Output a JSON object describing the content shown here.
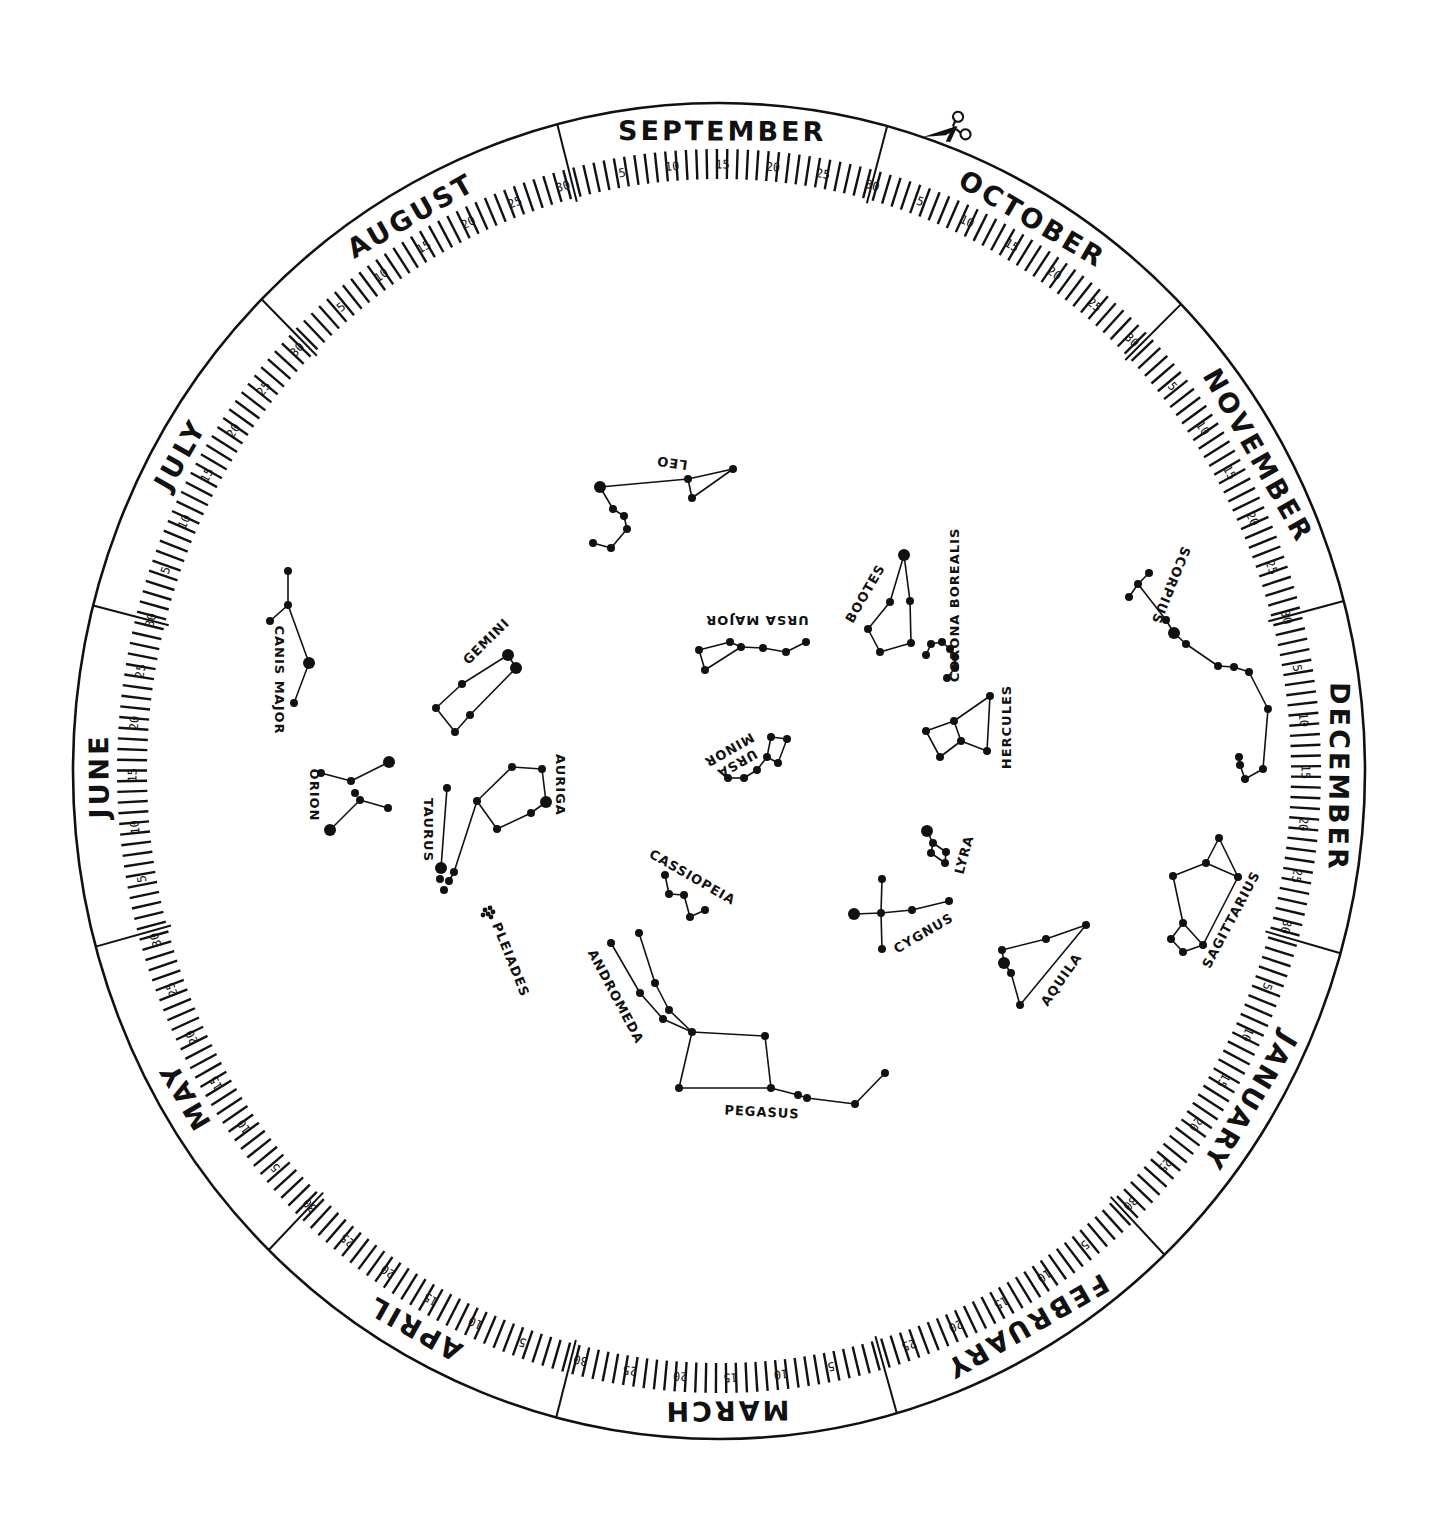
{
  "ring": {
    "center": [
      719,
      771
    ],
    "outer": [
      646,
      668
    ],
    "tick_base": [
      572,
      592
    ],
    "tick_len_minor": 30,
    "tick_len_major": 40,
    "label_radius": [
      618,
      638
    ],
    "start_angle_deg": -104.5,
    "color": "#111111"
  },
  "months": [
    {
      "name": "SEPTEMBER",
      "days": 30
    },
    {
      "name": "OCTOBER",
      "days": 31
    },
    {
      "name": "NOVEMBER",
      "days": 30
    },
    {
      "name": "DECEMBER",
      "days": 31
    },
    {
      "name": "JANUARY",
      "days": 31
    },
    {
      "name": "FEBRUARY",
      "days": 28
    },
    {
      "name": "MARCH",
      "days": 31
    },
    {
      "name": "APRIL",
      "days": 30
    },
    {
      "name": "MAY",
      "days": 31
    },
    {
      "name": "JUNE",
      "days": 30
    },
    {
      "name": "JULY",
      "days": 31
    },
    {
      "name": "AUGUST",
      "days": 31
    }
  ],
  "day_labels": [
    5,
    10,
    15,
    20,
    25,
    30
  ],
  "scissors": {
    "icon": "scissors-icon",
    "x": 948,
    "y": 130
  },
  "constellations": [
    {
      "name": "LEO",
      "label": {
        "x": 672,
        "y": 462,
        "rot": 188
      },
      "stars": [
        [
          600,
          487,
          6
        ],
        [
          613,
          509,
          4
        ],
        [
          624,
          516,
          4
        ],
        [
          627,
          529,
          4
        ],
        [
          611,
          548,
          4
        ],
        [
          593,
          543,
          4
        ],
        [
          688,
          479,
          4
        ],
        [
          692,
          498,
          4
        ],
        [
          733,
          469,
          4
        ]
      ],
      "lines": [
        [
          0,
          1
        ],
        [
          1,
          2
        ],
        [
          2,
          3
        ],
        [
          3,
          4
        ],
        [
          4,
          5
        ],
        [
          0,
          6
        ],
        [
          6,
          8
        ],
        [
          6,
          7
        ],
        [
          7,
          8
        ]
      ]
    },
    {
      "name": "URSA MAJOR",
      "label": {
        "x": 757,
        "y": 619,
        "rot": 180
      },
      "stars": [
        [
          730,
          642,
          4
        ],
        [
          699,
          650,
          4
        ],
        [
          705,
          670,
          4
        ],
        [
          741,
          647,
          4
        ],
        [
          763,
          648,
          4
        ],
        [
          786,
          652,
          4
        ],
        [
          806,
          642,
          4
        ]
      ],
      "lines": [
        [
          0,
          1
        ],
        [
          1,
          2
        ],
        [
          2,
          3
        ],
        [
          3,
          0
        ],
        [
          3,
          4
        ],
        [
          4,
          5
        ],
        [
          5,
          6
        ]
      ]
    },
    {
      "name": "URSA MINOR",
      "label": {
        "x": 735,
        "y": 760,
        "rot": 150,
        "two_line": [
          "URSA",
          "MINOR"
        ]
      },
      "stars": [
        [
          771,
          737,
          4
        ],
        [
          787,
          739,
          4
        ],
        [
          767,
          757,
          4
        ],
        [
          778,
          763,
          4
        ],
        [
          757,
          770,
          4
        ],
        [
          744,
          778,
          4
        ],
        [
          728,
          778,
          4
        ]
      ],
      "lines": [
        [
          0,
          1
        ],
        [
          1,
          3
        ],
        [
          3,
          2
        ],
        [
          2,
          0
        ],
        [
          2,
          4
        ],
        [
          4,
          5
        ],
        [
          5,
          6
        ]
      ]
    },
    {
      "name": "BOOTES",
      "label": {
        "x": 866,
        "y": 594,
        "rot": -60
      },
      "stars": [
        [
          904,
          555,
          6
        ],
        [
          890,
          602,
          4
        ],
        [
          910,
          601,
          4
        ],
        [
          868,
          629,
          4
        ],
        [
          880,
          652,
          4
        ],
        [
          911,
          643,
          4
        ]
      ],
      "lines": [
        [
          0,
          1
        ],
        [
          0,
          2
        ],
        [
          1,
          3
        ],
        [
          3,
          4
        ],
        [
          4,
          5
        ],
        [
          5,
          2
        ]
      ]
    },
    {
      "name": "CORONA BOREALIS",
      "label": {
        "x": 955,
        "y": 605,
        "rot": -90
      },
      "stars": [
        [
          926,
          655,
          4
        ],
        [
          931,
          644,
          4
        ],
        [
          942,
          642,
          4
        ],
        [
          950,
          649,
          4
        ],
        [
          955,
          657,
          4
        ],
        [
          955,
          668,
          4
        ],
        [
          947,
          678,
          4
        ]
      ],
      "lines": [
        [
          0,
          1
        ],
        [
          1,
          2
        ],
        [
          2,
          3
        ],
        [
          3,
          4
        ],
        [
          4,
          5
        ],
        [
          5,
          6
        ]
      ]
    },
    {
      "name": "HERCULES",
      "label": {
        "x": 1007,
        "y": 727,
        "rot": -90
      },
      "stars": [
        [
          990,
          696,
          4
        ],
        [
          954,
          721,
          4
        ],
        [
          926,
          731,
          4
        ],
        [
          940,
          757,
          4
        ],
        [
          961,
          741,
          4
        ],
        [
          987,
          751,
          4
        ]
      ],
      "lines": [
        [
          0,
          1
        ],
        [
          1,
          2
        ],
        [
          2,
          3
        ],
        [
          3,
          4
        ],
        [
          4,
          1
        ],
        [
          4,
          5
        ],
        [
          5,
          0
        ]
      ]
    },
    {
      "name": "LYRA",
      "label": {
        "x": 965,
        "y": 855,
        "rot": -75
      },
      "stars": [
        [
          927,
          831,
          6
        ],
        [
          933,
          843,
          4
        ],
        [
          931,
          853,
          4
        ],
        [
          946,
          852,
          4
        ],
        [
          945,
          863,
          4
        ]
      ],
      "lines": [
        [
          0,
          1
        ],
        [
          1,
          2
        ],
        [
          2,
          4
        ],
        [
          4,
          3
        ],
        [
          3,
          1
        ]
      ]
    },
    {
      "name": "CYGNUS",
      "label": {
        "x": 924,
        "y": 934,
        "rot": -30
      },
      "stars": [
        [
          882,
          879,
          4
        ],
        [
          854,
          914,
          6
        ],
        [
          881,
          913,
          4
        ],
        [
          912,
          910,
          4
        ],
        [
          949,
          901,
          4
        ],
        [
          882,
          949,
          4
        ]
      ],
      "lines": [
        [
          0,
          2
        ],
        [
          2,
          5
        ],
        [
          1,
          2
        ],
        [
          2,
          3
        ],
        [
          3,
          4
        ]
      ]
    },
    {
      "name": "AQUILA",
      "label": {
        "x": 1062,
        "y": 980,
        "rot": -55
      },
      "stars": [
        [
          1086,
          925,
          4
        ],
        [
          1046,
          939,
          4
        ],
        [
          1002,
          950,
          4
        ],
        [
          1004,
          963,
          6
        ],
        [
          1011,
          973,
          4
        ],
        [
          1020,
          1005,
          4
        ]
      ],
      "lines": [
        [
          0,
          1
        ],
        [
          1,
          2
        ],
        [
          2,
          3
        ],
        [
          3,
          4
        ],
        [
          4,
          5
        ],
        [
          5,
          0
        ]
      ]
    },
    {
      "name": "SCORPIUS",
      "label": {
        "x": 1170,
        "y": 585,
        "rot": 112
      },
      "stars": [
        [
          1149,
          573,
          4
        ],
        [
          1138,
          584,
          4
        ],
        [
          1129,
          597,
          4
        ],
        [
          1166,
          620,
          4
        ],
        [
          1174,
          633,
          6
        ],
        [
          1186,
          644,
          4
        ],
        [
          1218,
          666,
          4
        ],
        [
          1234,
          667,
          4
        ],
        [
          1249,
          672,
          4
        ],
        [
          1268,
          709,
          4
        ],
        [
          1263,
          769,
          4
        ],
        [
          1245,
          779,
          4
        ],
        [
          1240,
          765,
          4
        ],
        [
          1239,
          757,
          4
        ]
      ],
      "lines": [
        [
          0,
          1
        ],
        [
          1,
          2
        ],
        [
          1,
          3
        ],
        [
          3,
          4
        ],
        [
          4,
          5
        ],
        [
          5,
          6
        ],
        [
          6,
          7
        ],
        [
          7,
          8
        ],
        [
          8,
          9
        ],
        [
          9,
          10
        ],
        [
          10,
          11
        ],
        [
          11,
          12
        ],
        [
          12,
          13
        ]
      ]
    },
    {
      "name": "SAGITTARIUS",
      "label": {
        "x": 1232,
        "y": 920,
        "rot": -62
      },
      "stars": [
        [
          1219,
          838,
          4
        ],
        [
          1206,
          863,
          4
        ],
        [
          1173,
          876,
          4
        ],
        [
          1238,
          877,
          4
        ],
        [
          1183,
          923,
          4
        ],
        [
          1171,
          939,
          4
        ],
        [
          1183,
          952,
          4
        ],
        [
          1203,
          945,
          4
        ]
      ],
      "lines": [
        [
          0,
          1
        ],
        [
          0,
          3
        ],
        [
          1,
          2
        ],
        [
          1,
          3
        ],
        [
          2,
          4
        ],
        [
          4,
          5
        ],
        [
          5,
          6
        ],
        [
          6,
          7
        ],
        [
          7,
          4
        ],
        [
          7,
          3
        ]
      ]
    },
    {
      "name": "CASSIOPEIA",
      "label": {
        "x": 692,
        "y": 878,
        "rot": 30
      },
      "stars": [
        [
          665,
          875,
          4
        ],
        [
          669,
          894,
          4
        ],
        [
          684,
          895,
          4
        ],
        [
          690,
          917,
          4
        ],
        [
          705,
          910,
          4
        ]
      ],
      "lines": [
        [
          0,
          1
        ],
        [
          1,
          2
        ],
        [
          2,
          3
        ],
        [
          3,
          4
        ]
      ]
    },
    {
      "name": "ANDROMEDA",
      "label": {
        "x": 615,
        "y": 997,
        "rot": 62
      },
      "stars": [
        [
          611,
          943,
          4
        ],
        [
          639,
          933,
          4
        ],
        [
          640,
          993,
          4
        ],
        [
          655,
          983,
          4
        ],
        [
          669,
          1010,
          4
        ],
        [
          663,
          1019,
          4
        ]
      ],
      "lines": [
        [
          0,
          2
        ],
        [
          2,
          5
        ],
        [
          1,
          3
        ],
        [
          3,
          4
        ]
      ]
    },
    {
      "name": "PEGASUS",
      "label": {
        "x": 762,
        "y": 1113,
        "rot": 3
      },
      "stars": [
        [
          692,
          1032,
          4
        ],
        [
          765,
          1036,
          4
        ],
        [
          679,
          1088,
          4
        ],
        [
          771,
          1088,
          4
        ],
        [
          798,
          1095,
          4
        ],
        [
          807,
          1098,
          4
        ],
        [
          855,
          1104,
          4
        ],
        [
          885,
          1073,
          4
        ]
      ],
      "lines": [
        [
          0,
          1
        ],
        [
          1,
          3
        ],
        [
          3,
          2
        ],
        [
          2,
          0
        ],
        [
          3,
          4
        ],
        [
          4,
          5
        ],
        [
          5,
          6
        ],
        [
          6,
          7
        ]
      ],
      "extra_lines": [
        [
          669,
          1010,
          692,
          1032
        ],
        [
          663,
          1019,
          692,
          1032
        ]
      ]
    },
    {
      "name": "GEMINI",
      "label": {
        "x": 487,
        "y": 642,
        "rot": -45
      },
      "stars": [
        [
          508,
          655,
          6
        ],
        [
          516,
          668,
          6
        ],
        [
          462,
          684,
          4
        ],
        [
          436,
          708,
          4
        ],
        [
          455,
          732,
          4
        ],
        [
          470,
          715,
          4
        ]
      ],
      "lines": [
        [
          0,
          1
        ],
        [
          0,
          2
        ],
        [
          2,
          3
        ],
        [
          3,
          4
        ],
        [
          4,
          5
        ],
        [
          5,
          1
        ]
      ]
    },
    {
      "name": "CANIS MAJOR",
      "label": {
        "x": 278,
        "y": 680,
        "rot": 90
      },
      "stars": [
        [
          288,
          571,
          4
        ],
        [
          288,
          605,
          4
        ],
        [
          270,
          621,
          4
        ],
        [
          309,
          663,
          6
        ],
        [
          294,
          703,
          4
        ]
      ],
      "lines": [
        [
          0,
          1
        ],
        [
          1,
          2
        ],
        [
          1,
          3
        ],
        [
          3,
          4
        ]
      ]
    },
    {
      "name": "ORION",
      "label": {
        "x": 313,
        "y": 795,
        "rot": 90
      },
      "stars": [
        [
          389,
          762,
          6
        ],
        [
          321,
          773,
          4
        ],
        [
          351,
          781,
          4
        ],
        [
          355,
          793,
          4
        ],
        [
          360,
          800,
          4
        ],
        [
          388,
          808,
          4
        ],
        [
          330,
          830,
          6
        ]
      ],
      "lines": [
        [
          0,
          2
        ],
        [
          1,
          2
        ],
        [
          4,
          5
        ],
        [
          4,
          6
        ]
      ]
    },
    {
      "name": "TAURUS",
      "label": {
        "x": 427,
        "y": 830,
        "rot": 90
      },
      "stars": [
        [
          447,
          788,
          4
        ],
        [
          441,
          868,
          6
        ],
        [
          454,
          872,
          4
        ],
        [
          440,
          879,
          4
        ],
        [
          449,
          881,
          4
        ],
        [
          444,
          890,
          4
        ]
      ],
      "lines": [
        [
          0,
          1
        ],
        [
          2,
          4
        ]
      ],
      "extra_lines": [
        [
          454,
          872,
          477,
          801
        ]
      ]
    },
    {
      "name": "AURIGA",
      "label": {
        "x": 559,
        "y": 785,
        "rot": 90
      },
      "stars": [
        [
          477,
          801,
          4
        ],
        [
          512,
          767,
          4
        ],
        [
          542,
          769,
          4
        ],
        [
          546,
          802,
          6
        ],
        [
          531,
          813,
          4
        ],
        [
          497,
          829,
          4
        ]
      ],
      "lines": [
        [
          0,
          1
        ],
        [
          1,
          2
        ],
        [
          2,
          3
        ],
        [
          3,
          4
        ],
        [
          4,
          5
        ],
        [
          5,
          0
        ]
      ]
    },
    {
      "name": "PLEIADES",
      "label": {
        "x": 510,
        "y": 960,
        "rot": 68
      },
      "stars": [
        [
          485,
          910,
          2.4
        ],
        [
          490,
          908,
          2.4
        ],
        [
          488,
          914,
          2.4
        ],
        [
          493,
          912,
          2.4
        ],
        [
          483,
          915,
          2.4
        ],
        [
          491,
          917,
          2.4
        ]
      ],
      "lines": []
    }
  ]
}
